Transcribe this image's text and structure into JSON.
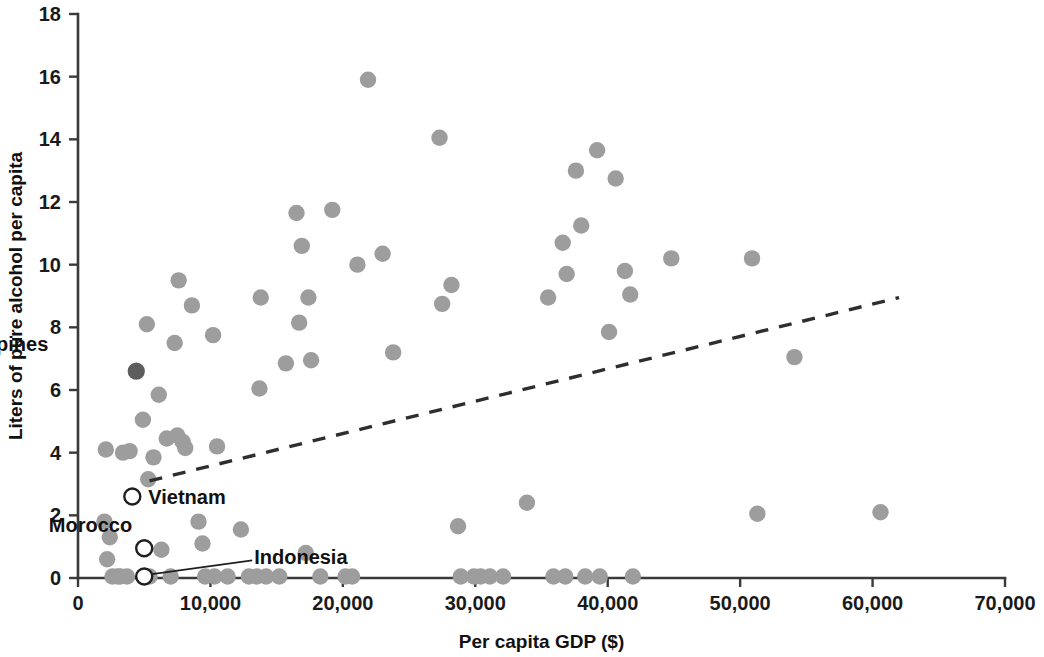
{
  "chart_data": {
    "type": "scatter",
    "title": "",
    "xlabel": "Per capita GDP ($)",
    "ylabel": "Liters of pure alcohol per capita",
    "xlim": [
      0,
      70000
    ],
    "ylim": [
      0,
      18
    ],
    "xticks": [
      0,
      10000,
      20000,
      30000,
      40000,
      50000,
      60000,
      70000
    ],
    "xticklabels": [
      "0",
      "10,000",
      "20,000",
      "30,000",
      "40,000",
      "50,000",
      "60,000",
      "70,000"
    ],
    "yticks": [
      0,
      2,
      4,
      6,
      8,
      10,
      12,
      14,
      16,
      18
    ],
    "yticklabels": [
      "0",
      "2",
      "4",
      "6",
      "8",
      "10",
      "12",
      "14",
      "16",
      "18"
    ],
    "grid": false,
    "legend": "none",
    "marker_color": "#9d9d9d",
    "highlight_color": "#5d5d5d",
    "open_marker_fill": "#ffffff",
    "open_marker_stroke": "#1f1f1f",
    "trendline": {
      "style": "dashed",
      "color": "#2e2e2e",
      "x_start": 5400,
      "y_start": 3.1,
      "x_end": 62000,
      "y_end": 8.95
    },
    "annotations": [
      {
        "label": "Philippines",
        "x": 4400,
        "y": 6.6,
        "marker": "filled-dark",
        "label_dx": -88,
        "label_dy": -20,
        "anchor": "end",
        "leader": false
      },
      {
        "label": "Vietnam",
        "x": 4100,
        "y": 2.6,
        "marker": "open",
        "label_dx": 16,
        "label_dy": 7,
        "anchor": "start",
        "leader": false
      },
      {
        "label": "Morocco",
        "x": 5000,
        "y": 0.95,
        "marker": "open",
        "label_dx": -12,
        "label_dy": -16,
        "anchor": "end",
        "leader": false
      },
      {
        "label": "Indonesia",
        "x": 5000,
        "y": 0.05,
        "marker": "open",
        "label_dx": 110,
        "label_dy": -12,
        "anchor": "start",
        "leader": true,
        "leader_to_dx": 108,
        "leader_to_dy": -16
      }
    ],
    "points": [
      {
        "x": 2100,
        "y": 4.1
      },
      {
        "x": 2000,
        "y": 1.8
      },
      {
        "x": 2200,
        "y": 0.6
      },
      {
        "x": 2400,
        "y": 1.3
      },
      {
        "x": 2600,
        "y": 0.05
      },
      {
        "x": 3000,
        "y": 0.05
      },
      {
        "x": 3200,
        "y": 0.05
      },
      {
        "x": 3400,
        "y": 4.0
      },
      {
        "x": 3900,
        "y": 4.05
      },
      {
        "x": 3700,
        "y": 0.05
      },
      {
        "x": 4400,
        "y": 6.6
      },
      {
        "x": 4100,
        "y": 2.6
      },
      {
        "x": 5000,
        "y": 0.95
      },
      {
        "x": 5000,
        "y": 0.05
      },
      {
        "x": 5300,
        "y": 3.15
      },
      {
        "x": 5400,
        "y": 0.05
      },
      {
        "x": 5200,
        "y": 8.1
      },
      {
        "x": 4900,
        "y": 5.05
      },
      {
        "x": 5700,
        "y": 3.85
      },
      {
        "x": 6100,
        "y": 5.85
      },
      {
        "x": 6700,
        "y": 4.45
      },
      {
        "x": 6300,
        "y": 0.9
      },
      {
        "x": 7000,
        "y": 0.05
      },
      {
        "x": 7300,
        "y": 7.5
      },
      {
        "x": 7600,
        "y": 9.5
      },
      {
        "x": 7500,
        "y": 4.55
      },
      {
        "x": 7900,
        "y": 4.35
      },
      {
        "x": 8100,
        "y": 4.15
      },
      {
        "x": 8600,
        "y": 8.7
      },
      {
        "x": 9100,
        "y": 1.8
      },
      {
        "x": 9400,
        "y": 1.1
      },
      {
        "x": 9600,
        "y": 0.05
      },
      {
        "x": 10200,
        "y": 7.75
      },
      {
        "x": 10500,
        "y": 4.2
      },
      {
        "x": 10300,
        "y": 0.05
      },
      {
        "x": 11300,
        "y": 0.05
      },
      {
        "x": 12300,
        "y": 1.55
      },
      {
        "x": 12900,
        "y": 0.05
      },
      {
        "x": 13500,
        "y": 0.05
      },
      {
        "x": 13700,
        "y": 6.05
      },
      {
        "x": 13800,
        "y": 8.95
      },
      {
        "x": 14200,
        "y": 0.05
      },
      {
        "x": 15200,
        "y": 0.05
      },
      {
        "x": 15700,
        "y": 6.85
      },
      {
        "x": 16500,
        "y": 11.65
      },
      {
        "x": 16700,
        "y": 8.15
      },
      {
        "x": 16900,
        "y": 10.6
      },
      {
        "x": 17200,
        "y": 0.8
      },
      {
        "x": 17400,
        "y": 8.95
      },
      {
        "x": 17600,
        "y": 6.95
      },
      {
        "x": 18300,
        "y": 0.05
      },
      {
        "x": 19200,
        "y": 11.75
      },
      {
        "x": 20200,
        "y": 0.05
      },
      {
        "x": 20700,
        "y": 0.05
      },
      {
        "x": 21100,
        "y": 10.0
      },
      {
        "x": 21900,
        "y": 15.9
      },
      {
        "x": 23000,
        "y": 10.35
      },
      {
        "x": 23800,
        "y": 7.2
      },
      {
        "x": 27300,
        "y": 14.05
      },
      {
        "x": 27500,
        "y": 8.75
      },
      {
        "x": 28200,
        "y": 9.35
      },
      {
        "x": 28700,
        "y": 1.65
      },
      {
        "x": 28900,
        "y": 0.05
      },
      {
        "x": 29900,
        "y": 0.05
      },
      {
        "x": 30400,
        "y": 0.05
      },
      {
        "x": 31100,
        "y": 0.05
      },
      {
        "x": 32100,
        "y": 0.05
      },
      {
        "x": 33900,
        "y": 2.4
      },
      {
        "x": 35500,
        "y": 8.95
      },
      {
        "x": 35900,
        "y": 0.05
      },
      {
        "x": 36600,
        "y": 10.7
      },
      {
        "x": 36900,
        "y": 9.7
      },
      {
        "x": 36800,
        "y": 0.05
      },
      {
        "x": 37600,
        "y": 13.0
      },
      {
        "x": 38000,
        "y": 11.25
      },
      {
        "x": 38300,
        "y": 0.05
      },
      {
        "x": 39200,
        "y": 13.65
      },
      {
        "x": 39400,
        "y": 0.05
      },
      {
        "x": 40100,
        "y": 7.85
      },
      {
        "x": 40600,
        "y": 12.75
      },
      {
        "x": 41300,
        "y": 9.8
      },
      {
        "x": 41700,
        "y": 9.05
      },
      {
        "x": 41900,
        "y": 0.05
      },
      {
        "x": 44800,
        "y": 10.2
      },
      {
        "x": 50900,
        "y": 10.2
      },
      {
        "x": 51300,
        "y": 2.05
      },
      {
        "x": 54100,
        "y": 7.05
      },
      {
        "x": 60600,
        "y": 2.1
      }
    ]
  },
  "axes": {
    "x_label": "Per capita GDP ($)",
    "y_label": "Liters of pure alcohol per capita"
  }
}
